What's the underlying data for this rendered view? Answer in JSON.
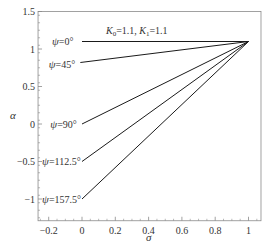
{
  "chart_data": {
    "type": "line",
    "title": "",
    "xlabel": "σ",
    "ylabel": "α",
    "xlim": [
      -0.264,
      1.075
    ],
    "ylim": [
      -1.29,
      1.5
    ],
    "grid": false,
    "legend": "none (inline labels)",
    "x_ticks": [
      -0.2,
      0,
      0.2,
      0.4,
      0.6,
      0.8,
      1
    ],
    "x_tick_labels": [
      "-0.2",
      "0",
      "0.2",
      "0.4",
      "0.6",
      "0.8",
      "1"
    ],
    "y_ticks": [
      -1,
      -0.5,
      0,
      0.5,
      1,
      1.5
    ],
    "y_tick_labels": [
      "-1",
      "-0.5",
      "0",
      "0.5",
      "1",
      "1.5"
    ],
    "annotation": {
      "text_parts": [
        "K",
        "0",
        "=1.1, ",
        "K",
        "1",
        "=1.1"
      ],
      "plain": "K0=1.1, K1=1.1",
      "x": 0.14,
      "y": 1.25
    },
    "series": [
      {
        "name": "ψ=0°",
        "label": "ψ=0°",
        "x": [
          0,
          1
        ],
        "y": [
          1.1,
          1.1
        ],
        "label_at": [
          -0.18,
          1.1
        ]
      },
      {
        "name": "ψ=45°",
        "label": "ψ=45°",
        "x": [
          -0.01,
          1
        ],
        "y": [
          0.82,
          1.1
        ],
        "label_at": [
          -0.2,
          0.8
        ]
      },
      {
        "name": "ψ=90°",
        "label": "ψ=90°",
        "x": [
          0,
          1
        ],
        "y": [
          0,
          1.1
        ],
        "label_at": [
          -0.19,
          -0.01
        ]
      },
      {
        "name": "ψ=112.5°",
        "label": "ψ=112.5°",
        "x": [
          0,
          1
        ],
        "y": [
          -0.5,
          1.1
        ],
        "label_at": [
          -0.24,
          -0.5
        ]
      },
      {
        "name": "ψ=157.5°",
        "label": "ψ=157.5°",
        "x": [
          0,
          1
        ],
        "y": [
          -1,
          1.1
        ],
        "label_at": [
          -0.24,
          -1.0
        ]
      }
    ],
    "colors": {
      "line": "#1a1a1a",
      "frame": "#8a8a8a",
      "text": "#333333"
    }
  }
}
